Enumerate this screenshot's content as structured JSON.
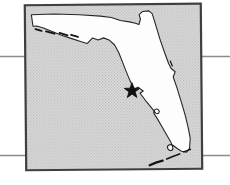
{
  "colors": {
    "page_bg": "#ffffff",
    "rule_line": "#8c8c8c",
    "frame_border": "#3f3f3f",
    "water_base": "#e0e0e0",
    "water_dot": "#b4b4b4",
    "land_fill": "#fdfdfd",
    "coast_stroke": "#262626",
    "detail_ink": "#141414",
    "marker_fill": "#101010"
  },
  "map": {
    "region": "Florida",
    "marker": {
      "shape": "star",
      "x": 132,
      "y": 91
    }
  }
}
